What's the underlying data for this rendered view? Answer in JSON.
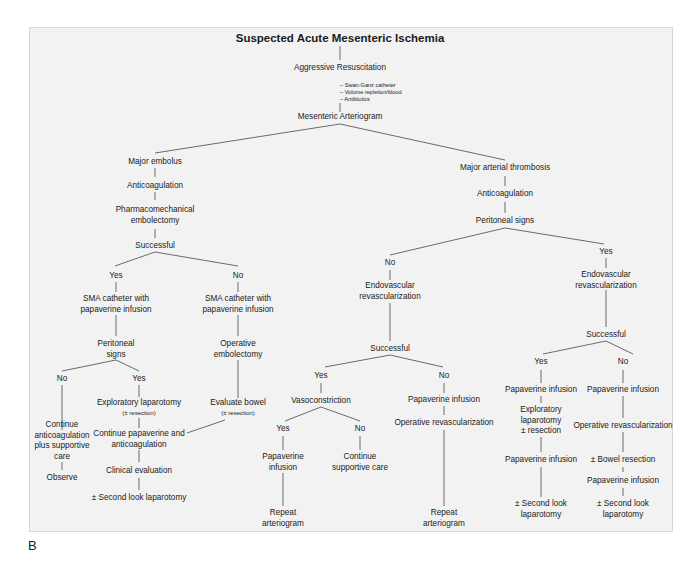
{
  "title": "Suspected Acute Mesenteric Ischemia",
  "resuscitation": {
    "label": "Aggressive Resuscitation",
    "items": [
      "Swan-Ganz catheter",
      "Volume repletion/blood",
      "Antibiotics"
    ]
  },
  "arteriogram": "Mesenteric Arteriogram",
  "embolus_branch": {
    "label": "Major embolus",
    "anticoag": "Anticoagulation",
    "procedure": [
      "Pharmacomechanical",
      "embolectomy"
    ],
    "successful": "Successful",
    "yes": {
      "label": "Yes",
      "sma": [
        "SMA catheter with",
        "papaverine infusion"
      ],
      "peritoneal": [
        "Peritoneal",
        "signs"
      ],
      "no": {
        "label": "No",
        "action": [
          "Continue",
          "anticoagulation",
          "plus supportive",
          "care"
        ],
        "observe": "Observe"
      },
      "yes": {
        "label": "Yes",
        "action": "Exploratory laparotomy",
        "action_sub": "(± resection)"
      }
    },
    "no": {
      "label": "No",
      "sma": [
        "SMA catheter with",
        "papaverine infusion"
      ],
      "operative": [
        "Operative",
        "embolectomy"
      ],
      "evaluate": "Evaluate bowel",
      "evaluate_sub": "(± resection)"
    },
    "merge": {
      "continue": [
        "Continue papaverine and",
        "anticoagulation"
      ],
      "clinical": "Clinical evaluation",
      "second_look": "± Second look laparotomy"
    }
  },
  "thrombosis_branch": {
    "label": "Major arterial thrombosis",
    "anticoag": "Anticoagulation",
    "peritoneal": "Peritoneal signs",
    "no": {
      "label": "No",
      "endo": [
        "Endovascular",
        "revascularization"
      ],
      "successful": "Successful",
      "yes": {
        "label": "Yes",
        "vaso": "Vasoconstriction",
        "vaso_yes": {
          "label": "Yes",
          "papaverine": [
            "Papaverine",
            "infusion"
          ],
          "repeat": [
            "Repeat",
            "arteriogram"
          ]
        },
        "vaso_no": {
          "label": "No",
          "care": [
            "Continue",
            "supportive care"
          ]
        }
      },
      "no": {
        "label": "No",
        "papaverine": "Papaverine infusion",
        "operative": "Operative revascularization",
        "repeat": [
          "Repeat",
          "arteriogram"
        ]
      }
    },
    "yes": {
      "label": "Yes",
      "endo": [
        "Endovascular",
        "revascularization"
      ],
      "successful": "Successful",
      "yes": {
        "label": "Yes",
        "papaverine1": "Papaverine infusion",
        "explore": [
          "Exploratory",
          "laparotomy",
          "± resection"
        ],
        "papaverine2": "Papaverine infusion",
        "second_look": [
          "± Second look",
          "laparotomy"
        ]
      },
      "no": {
        "label": "No",
        "papaverine1": "Papaverine infusion",
        "operative": "Operative revascularization",
        "bowel": "± Bowel resection",
        "papaverine2": "Papaverine infusion",
        "second_look": [
          "± Second look",
          "laparotomy"
        ]
      }
    }
  },
  "figure_label": "B",
  "colors": {
    "panel_bg": "#f2f2f2",
    "line": "#6a6a6a",
    "text": "#1a1a1a"
  }
}
